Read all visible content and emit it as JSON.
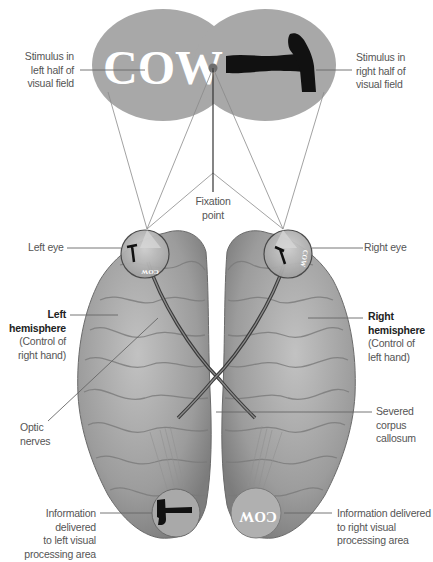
{
  "diagram": {
    "stimuli": {
      "left_word": "COW",
      "right_object": "hammer",
      "left_field_color": "#a6a6a6",
      "right_field_color": "#a6a6a6",
      "fixation_dot_color": "#707070"
    },
    "labels": {
      "stim_left": [
        "Stimulus in",
        "left half of",
        "visual field"
      ],
      "stim_right": [
        "Stimulus in",
        "right half of",
        "visual field"
      ],
      "fixation": [
        "Fixation",
        "point"
      ],
      "left_eye": "Left eye",
      "right_eye": "Right eye",
      "left_hemi_title": [
        "Left",
        "hemisphere"
      ],
      "left_hemi_sub": [
        "(Control of",
        "right hand)"
      ],
      "right_hemi_title": [
        "Right",
        "hemisphere"
      ],
      "right_hemi_sub": [
        "(Control of",
        "left hand)"
      ],
      "optic": [
        "Optic",
        "nerves"
      ],
      "corpus": [
        "Severed",
        "corpus",
        "callosum"
      ],
      "info_left": [
        "Information delivered",
        "to left visual",
        "processing area"
      ],
      "info_right": [
        "Information delivered",
        "to right visual",
        "processing area"
      ]
    },
    "eye_images": {
      "left_eye_word": "COW",
      "right_eye_word": "COW"
    },
    "processing_areas": {
      "left": "hammer",
      "right_word": "COW"
    },
    "colors": {
      "brain": "#9a9a9a",
      "brain_light": "#c4c4c4",
      "brain_dark": "#6e6e6e",
      "leader_line": "#777777",
      "text": "#555555",
      "text_bold": "#222222"
    }
  }
}
